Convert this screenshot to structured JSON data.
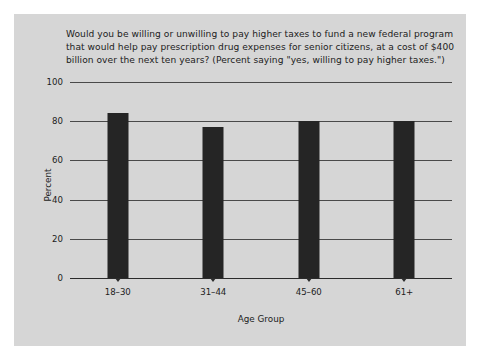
{
  "chart_data": {
    "type": "bar",
    "title": "Would you be willing or unwilling to pay higher taxes to fund a new federal program that would help pay prescription drug expenses for senior citizens, at a cost of $400 billion over the next ten years? (Percent saying \"yes, willing to pay higher taxes.\")",
    "categories": [
      "18–30",
      "31–44",
      "45–60",
      "61+"
    ],
    "values": [
      84,
      77,
      80,
      80
    ],
    "xlabel": "Age Group",
    "ylabel": "Percent",
    "ylim": [
      0,
      100
    ],
    "yticks": [
      0,
      20,
      40,
      60,
      80,
      100
    ],
    "ytick_labels": [
      "0",
      "20",
      "40",
      "60",
      "80",
      "100"
    ],
    "grid": true,
    "legend": null,
    "bar_color": "#252525",
    "background_color": "#d6d6d6",
    "axis_color": "#2b2b2b"
  }
}
